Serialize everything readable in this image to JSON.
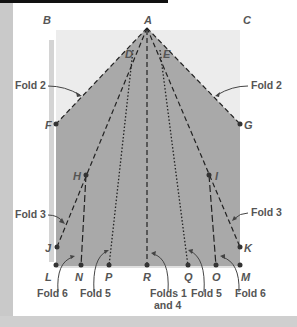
{
  "colors": {
    "paper_folded": "#a9a9a9",
    "paper_unfolded": "#ececec",
    "line": "#222222",
    "label": "#555555",
    "frame": "#c9c9c9"
  },
  "points": {
    "A": {
      "label": "A",
      "x": 147,
      "y": 28
    },
    "B": {
      "label": "B",
      "x": 47,
      "y": 23
    },
    "C": {
      "label": "C",
      "x": 247,
      "y": 23
    },
    "D": {
      "label": "D",
      "x": 130,
      "y": 55
    },
    "E": {
      "label": "E",
      "x": 164,
      "y": 55
    },
    "F": {
      "label": "F",
      "x": 56,
      "y": 124
    },
    "G": {
      "label": "G",
      "x": 240,
      "y": 124
    },
    "H": {
      "label": "H",
      "x": 86,
      "y": 175
    },
    "I": {
      "label": "I",
      "x": 209,
      "y": 175
    },
    "J": {
      "label": "J",
      "x": 57,
      "y": 247
    },
    "K": {
      "label": "K",
      "x": 240,
      "y": 247
    },
    "L": {
      "label": "L",
      "x": 56,
      "y": 266
    },
    "N": {
      "label": "N",
      "x": 81,
      "y": 266
    },
    "P": {
      "label": "P",
      "x": 109,
      "y": 266
    },
    "R": {
      "label": "R",
      "x": 147,
      "y": 266
    },
    "Q": {
      "label": "Q",
      "x": 188,
      "y": 266
    },
    "O": {
      "label": "O",
      "x": 216,
      "y": 266
    },
    "M": {
      "label": "M",
      "x": 240,
      "y": 266
    }
  },
  "fold_labels": {
    "fold2_left": "Fold 2",
    "fold2_right": "Fold 2",
    "fold3_left": "Fold 3",
    "fold3_right": "Fold 3",
    "fold6_left": "Fold 6",
    "fold5_left": "Fold 5",
    "folds14_line1": "Folds 1",
    "folds14_line2": "and 4",
    "fold5_right": "Fold 5",
    "fold6_right": "Fold 6"
  }
}
